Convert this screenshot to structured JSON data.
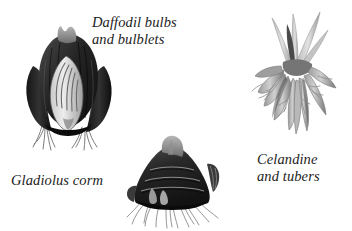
{
  "illustration": {
    "title": "Bulbs, corms and tubers",
    "background_color": "#ffffff",
    "ink_color": "#1c1c1c",
    "style": "grayscale engraving",
    "specimens": [
      {
        "id": "daffodil",
        "caption": "Daffodil bulbs\nand bulblets",
        "caption_line_1": "Daffodil bulbs",
        "caption_line_2": "and bulblets",
        "structure": "bulb",
        "parts": [
          "outer scales",
          "cut-away bulblet",
          "neck",
          "roots"
        ],
        "tone": "#2a2a2a"
      },
      {
        "id": "gladiolus",
        "caption": "Gladiolus corm",
        "structure": "corm",
        "parts": [
          "banded ridges",
          "apical bud",
          "side shoots",
          "fibrous roots"
        ],
        "tone": "#2e2e2e"
      },
      {
        "id": "celandine",
        "caption": "Celandine\nand tubers",
        "caption_line_1": "Celandine",
        "caption_line_2": "and tubers",
        "structure": "tuber cluster",
        "parts": [
          "leaf shoots",
          "finger tubers",
          "crown",
          "fine roots"
        ],
        "tone": "#8a8a8a"
      }
    ]
  }
}
